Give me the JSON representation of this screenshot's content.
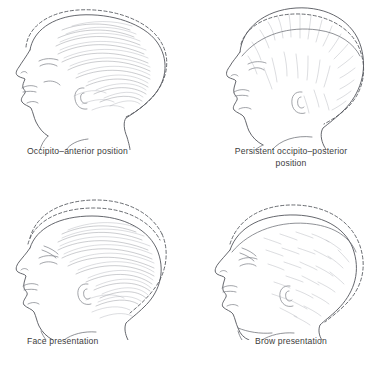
{
  "figure": {
    "background_color": "#ffffff",
    "line_color": "#53565c",
    "caption_color": "#3c3c3c",
    "dashed_line_meaning": "moulded / alternative skull contour"
  },
  "panels": [
    {
      "id": "occipito-anterior",
      "caption": "Occipito–anterior position",
      "caption_align": "left",
      "head_orientation": "left-facing profile",
      "dashed_outlines": 1
    },
    {
      "id": "persistent-occipito-posterior",
      "caption": "Persistent occipito–posterior\nposition",
      "caption_align": "center",
      "head_orientation": "left-facing profile",
      "dashed_outlines": 1
    },
    {
      "id": "face-presentation",
      "caption": "Face presentation",
      "caption_align": "left",
      "head_orientation": "left-facing profile, chin extended",
      "dashed_outlines": 2
    },
    {
      "id": "brow-presentation",
      "caption": "Brow presentation",
      "caption_align": "center",
      "head_orientation": "left-facing profile, brow leading",
      "dashed_outlines": 1
    }
  ]
}
